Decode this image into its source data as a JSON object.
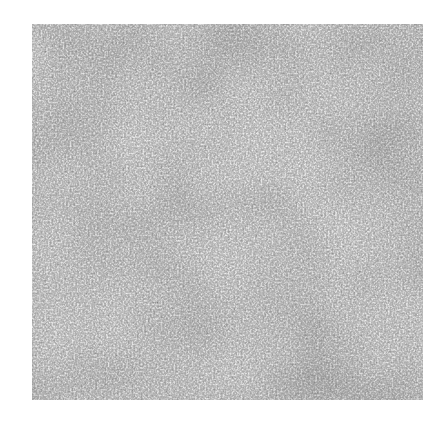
{
  "image": {
    "description": "Grayscale micrograph-like texture of a dense interwoven fibrous network",
    "background_color": "#ffffff",
    "texture": {
      "base_color": "#8a8a8a",
      "fiber_color": "#e6e6e6",
      "dark_pore_color": "#2e2e2e",
      "bounds": {
        "x": 32,
        "y": 24,
        "width": 391,
        "height": 376
      }
    }
  }
}
